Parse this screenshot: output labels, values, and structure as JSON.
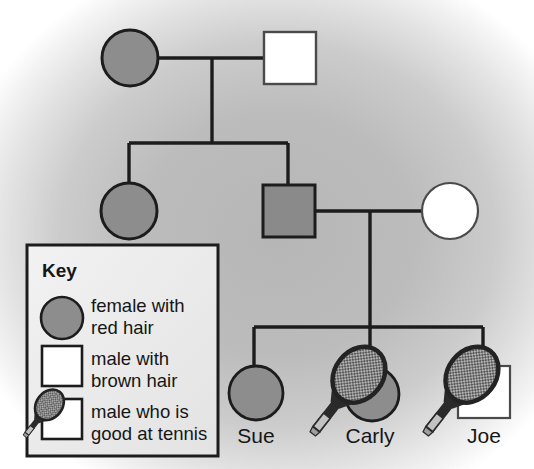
{
  "figure": {
    "type": "pedigree-chart",
    "background": {
      "base_color": "#ffffff",
      "vignette_color": "#b9b9b9",
      "description": "light grey radial shading behind the chart"
    },
    "colors": {
      "line": "#1c1c1c",
      "filled_gray": "#8d8d8d",
      "unfilled_white": "#ffffff",
      "square_gray": "#8a8a8a",
      "racket_dark": "#4b4b4b",
      "racket_handle": "#b5b5b5",
      "text": "#161616"
    }
  },
  "key": {
    "title": "Key",
    "entries": [
      {
        "symbol": "filled-circle",
        "shape": "circle",
        "fill": "#8d8d8d",
        "line1": "female with",
        "line2": "red hair",
        "text": "female with red hair"
      },
      {
        "symbol": "open-square",
        "shape": "square",
        "fill": "#ffffff",
        "line1": "male with",
        "line2": "brown hair",
        "text": "male with brown hair"
      },
      {
        "symbol": "square-with-racket",
        "shape": "square",
        "fill": "#ffffff",
        "overlay": "tennis-racket",
        "line1": "male who is",
        "line2": "good at tennis",
        "text": "male who is good at tennis"
      }
    ]
  },
  "pedigree": {
    "generations": [
      {
        "id": "generation-1",
        "individuals": [
          {
            "id": "g1-mother",
            "sex": "female",
            "shape": "circle",
            "fill": "filled",
            "trait": "red hair",
            "label": "",
            "tennis": false,
            "cx": 130,
            "cy": 58,
            "r": 28
          },
          {
            "id": "g1-father",
            "sex": "male",
            "shape": "square",
            "fill": "open",
            "trait": "brown hair",
            "label": "",
            "tennis": false,
            "x": 264,
            "y": 32,
            "size": 52
          }
        ]
      },
      {
        "id": "generation-2",
        "individuals": [
          {
            "id": "g2-daughter",
            "sex": "female",
            "shape": "circle",
            "fill": "filled",
            "trait": "red hair",
            "label": "",
            "tennis": false,
            "cx": 129,
            "cy": 211,
            "r": 28
          },
          {
            "id": "g2-son",
            "sex": "male",
            "shape": "square",
            "fill": "filled",
            "trait": "red hair",
            "label": "",
            "tennis": false,
            "x": 263,
            "y": 185,
            "size": 52
          },
          {
            "id": "g2-son-partner",
            "sex": "female",
            "shape": "circle",
            "fill": "open",
            "trait": "not red hair",
            "label": "",
            "tennis": false,
            "cx": 450,
            "cy": 211,
            "r": 28
          }
        ]
      },
      {
        "id": "generation-3",
        "individuals": [
          {
            "id": "g3-sue",
            "sex": "female",
            "shape": "circle",
            "fill": "filled",
            "trait": "red hair",
            "label": "Sue",
            "tennis": false,
            "cx": 256,
            "cy": 393,
            "r": 27
          },
          {
            "id": "g3-carly",
            "sex": "female",
            "shape": "circle",
            "fill": "filled",
            "trait": "red hair",
            "label": "Carly",
            "tennis": true,
            "cx": 370,
            "cy": 393,
            "r": 27
          },
          {
            "id": "g3-joe",
            "sex": "male",
            "shape": "square",
            "fill": "open",
            "trait": "brown hair",
            "label": "Joe",
            "tennis": true,
            "x": 458,
            "y": 366,
            "size": 52
          }
        ]
      }
    ],
    "labels": [
      {
        "text": "Sue",
        "x": 256,
        "y": 443
      },
      {
        "text": "Carly",
        "x": 370,
        "y": 443
      },
      {
        "text": "Joe",
        "x": 484,
        "y": 443
      }
    ]
  }
}
